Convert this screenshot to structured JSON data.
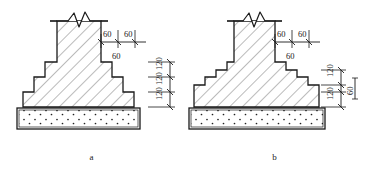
{
  "drawing": {
    "title": "Stepped masonry foundation sections",
    "line_color": "#1a1a1a",
    "hatch_color": "#555555",
    "concrete_fill": "#ffffff"
  },
  "figures": [
    {
      "id": "a",
      "caption": "a",
      "wall": {
        "break_symbol": "zigzag"
      },
      "step_offsets": {
        "labels": [
          "60",
          "60",
          "60"
        ],
        "top_left": "60",
        "top_right": "60",
        "bottom_center": "60"
      },
      "course_heights": {
        "labels": [
          "120",
          "120",
          "120"
        ],
        "count": 3
      },
      "steps": 3,
      "footing": {
        "material": "concrete",
        "pattern": "stipple"
      }
    },
    {
      "id": "b",
      "caption": "b",
      "wall": {
        "break_symbol": "zigzag"
      },
      "step_offsets": {
        "labels": [
          "60",
          "60",
          "60"
        ],
        "top_left": "60",
        "top_right": "60",
        "bottom_center": "60"
      },
      "course_heights": {
        "labels": [
          "120",
          "60",
          "120"
        ],
        "count": 3
      },
      "steps": 5,
      "footing": {
        "material": "concrete",
        "pattern": "stipple"
      }
    }
  ]
}
